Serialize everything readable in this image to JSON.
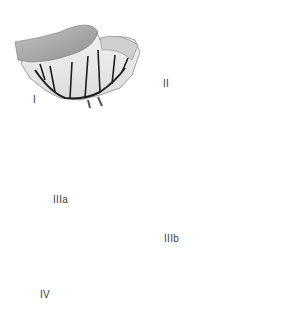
{
  "figure": {
    "panels": [
      {
        "id": "I",
        "label": "I"
      },
      {
        "id": "II",
        "label": "II"
      },
      {
        "id": "IIIa",
        "label": "IIIa"
      },
      {
        "id": "IIIb",
        "label": "IIIb"
      },
      {
        "id": "IV",
        "label": "IV"
      }
    ]
  },
  "colors": {
    "bowel_fill": "#a8a8a8",
    "bowel_light": "#d6d6d6",
    "mesentery": "#ececec",
    "vessel": "#1e1e1e",
    "outline": "#7a7a7a"
  }
}
